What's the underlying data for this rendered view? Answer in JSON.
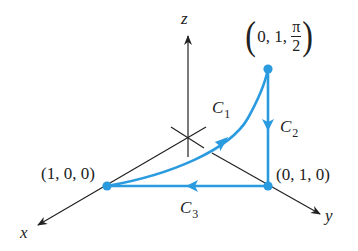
{
  "colors": {
    "curve": "#2b9be0",
    "axis": "#222222",
    "text": "#222222"
  },
  "axes": {
    "x_label": "x",
    "y_label": "y",
    "z_label": "z"
  },
  "points": [
    {
      "name": "point-1-0-0",
      "label": "(1, 0, 0)"
    },
    {
      "name": "point-0-1-0",
      "label": "(0, 1, 0)"
    },
    {
      "name": "point-0-1-pi-2",
      "label_prefix": "0, 1,",
      "frac_num": "π",
      "frac_den": "2",
      "paren_open": "(",
      "paren_close": ")"
    }
  ],
  "curves": [
    {
      "name": "C",
      "sub": "1",
      "from": "(1, 0, 0)",
      "to": "(0, 1, π/2)"
    },
    {
      "name": "C",
      "sub": "2",
      "from": "(0, 1, π/2)",
      "to": "(0, 1, 0)"
    },
    {
      "name": "C",
      "sub": "3",
      "from": "(0, 1, 0)",
      "to": "(1, 0, 0)"
    }
  ]
}
